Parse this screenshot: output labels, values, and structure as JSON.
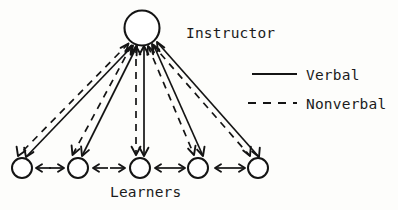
{
  "diagram": {
    "title_label": "Instructor",
    "group_label": "Learners",
    "nodes": {
      "instructor": {
        "id": "instructor",
        "label": "Instructor",
        "cx": 142,
        "cy": 28,
        "r": 17.5
      },
      "learners": [
        {
          "id": "learner-1",
          "cx": 22,
          "cy": 168,
          "r": 10
        },
        {
          "id": "learner-2",
          "cx": 78,
          "cy": 168,
          "r": 10
        },
        {
          "id": "learner-3",
          "cx": 140,
          "cy": 168,
          "r": 10
        },
        {
          "id": "learner-4",
          "cx": 198,
          "cy": 168,
          "r": 10
        },
        {
          "id": "learner-5",
          "cx": 258,
          "cy": 168,
          "r": 10
        }
      ]
    },
    "edges": [
      {
        "from": "instructor",
        "to": "learner-1",
        "kind": "verbal",
        "style": "solid",
        "bidirectional": true
      },
      {
        "from": "instructor",
        "to": "learner-1",
        "kind": "nonverbal",
        "style": "dashed",
        "bidirectional": true
      },
      {
        "from": "instructor",
        "to": "learner-2",
        "kind": "verbal",
        "style": "solid",
        "bidirectional": true
      },
      {
        "from": "instructor",
        "to": "learner-2",
        "kind": "nonverbal",
        "style": "dashed",
        "bidirectional": true
      },
      {
        "from": "instructor",
        "to": "learner-3",
        "kind": "verbal",
        "style": "solid",
        "bidirectional": true
      },
      {
        "from": "instructor",
        "to": "learner-3",
        "kind": "nonverbal",
        "style": "dashed",
        "bidirectional": true
      },
      {
        "from": "instructor",
        "to": "learner-4",
        "kind": "verbal",
        "style": "solid",
        "bidirectional": true
      },
      {
        "from": "instructor",
        "to": "learner-4",
        "kind": "nonverbal",
        "style": "dashed",
        "bidirectional": true
      },
      {
        "from": "instructor",
        "to": "learner-5",
        "kind": "verbal",
        "style": "solid",
        "bidirectional": true
      },
      {
        "from": "instructor",
        "to": "learner-5",
        "kind": "nonverbal",
        "style": "dashed",
        "bidirectional": true
      },
      {
        "from": "learner-2",
        "to": "learner-1",
        "kind": "verbal",
        "style": "solid",
        "bidirectional": false
      },
      {
        "from": "learner-3",
        "to": "learner-2",
        "kind": "verbal",
        "style": "solid",
        "bidirectional": false
      },
      {
        "from": "learner-4",
        "to": "learner-3",
        "kind": "verbal",
        "style": "solid",
        "bidirectional": false
      },
      {
        "from": "learner-5",
        "to": "learner-4",
        "kind": "verbal",
        "style": "solid",
        "bidirectional": false
      }
    ]
  },
  "legend": {
    "position": "top-right",
    "items": [
      {
        "id": "legend-verbal",
        "label": "Verbal",
        "style": "solid",
        "line_x1": 252,
        "line_x2": 297,
        "line_y": 74
      },
      {
        "id": "legend-nonverbal",
        "label": "Nonverbal",
        "style": "dashed",
        "line_x1": 248,
        "line_x2": 297,
        "line_y": 103
      }
    ]
  },
  "labels": {
    "instructor": {
      "text": "Instructor",
      "x": 186,
      "y": 38
    },
    "learners": {
      "text": "Learners",
      "x": 110,
      "y": 197
    },
    "legend_verbal": {
      "text": "Verbal",
      "x": 306,
      "y": 80
    },
    "legend_nonverbal": {
      "text": "Nonverbal",
      "x": 306,
      "y": 109
    }
  },
  "colors": {
    "ink": "#141414",
    "background": "#fdfdfb",
    "node_fill": "#ffffff"
  }
}
